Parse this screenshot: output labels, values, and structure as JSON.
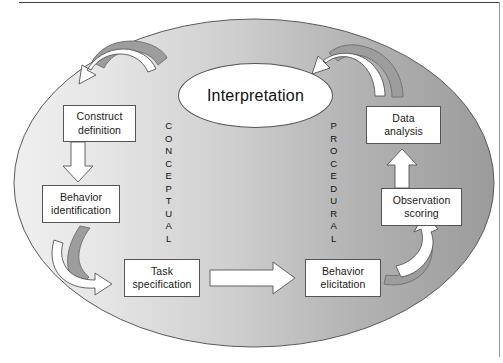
{
  "figure": {
    "background_color": "#ffffff",
    "ellipse": {
      "name": "assessment-cycle-ellipse",
      "gradient_from": "#ededed",
      "gradient_to": "#a0a0a0",
      "stroke": "#5a5a5a"
    },
    "rules": {
      "top_rule_color": "#3d3d3d",
      "right_rule_color": "#9a9a9a"
    }
  },
  "center": {
    "label": "Interpretation",
    "fill": "#ffffff",
    "stroke": "#555555"
  },
  "side_labels": {
    "left": {
      "text": "CONCEPTUAL",
      "letters": [
        "C",
        "O",
        "N",
        "C",
        "E",
        "P",
        "T",
        "U",
        "A",
        "L"
      ]
    },
    "right": {
      "text": "PROCEDURAL",
      "letters": [
        "P",
        "R",
        "O",
        "C",
        "E",
        "D",
        "U",
        "R",
        "A",
        "L"
      ]
    }
  },
  "nodes": [
    {
      "id": "construct-definition",
      "line1": "Construct",
      "line2": "definition"
    },
    {
      "id": "behavior-identification",
      "line1": "Behavior",
      "line2": "identification"
    },
    {
      "id": "task-specification",
      "line1": "Task",
      "line2": "specification"
    },
    {
      "id": "behavior-elicitation",
      "line1": "Behavior",
      "line2": "elicitation"
    },
    {
      "id": "observation-scoring",
      "line1": "Observation",
      "line2": "scoring"
    },
    {
      "id": "data-analysis",
      "line1": "Data",
      "line2": "analysis"
    }
  ],
  "arrows": [
    {
      "id": "arrow-interpretation-to-construct",
      "kind": "curved",
      "direction": "left-down",
      "fill": "#ffffff",
      "shadow_fill": "#9d9d9d"
    },
    {
      "id": "arrow-construct-to-behavior",
      "kind": "straight",
      "direction": "down",
      "fill": "#ffffff"
    },
    {
      "id": "arrow-behavior-to-task",
      "kind": "curved",
      "direction": "right-down",
      "fill": "#ffffff",
      "shadow_fill": "#9d9d9d"
    },
    {
      "id": "arrow-task-to-elicitation",
      "kind": "straight",
      "direction": "right",
      "fill": "#ffffff"
    },
    {
      "id": "arrow-elicitation-to-observation",
      "kind": "curved",
      "direction": "up-right",
      "fill": "#ffffff",
      "shadow_fill": "#9d9d9d"
    },
    {
      "id": "arrow-observation-to-data",
      "kind": "straight",
      "direction": "up",
      "fill": "#ffffff"
    },
    {
      "id": "arrow-data-to-interpretation",
      "kind": "curved",
      "direction": "left-up",
      "fill": "#ffffff",
      "shadow_fill": "#9d9d9d"
    }
  ]
}
